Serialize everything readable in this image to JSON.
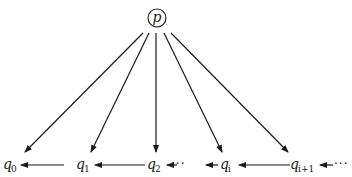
{
  "diagram": {
    "root": {
      "label": "p",
      "shape": "circle"
    },
    "nodes": [
      {
        "id": "q0",
        "base": "q",
        "sub": "0"
      },
      {
        "id": "q1",
        "base": "q",
        "sub": "1"
      },
      {
        "id": "q2",
        "base": "q",
        "sub": "2"
      },
      {
        "id": "qi",
        "base": "q",
        "sub": "i"
      },
      {
        "id": "qi1",
        "base": "q",
        "sub": "i+1"
      }
    ],
    "ellipsis": "···",
    "edges_from_root": [
      "q0",
      "q1",
      "q2",
      "qi",
      "qi1"
    ],
    "chain_edges": [
      {
        "from": "q1",
        "to": "q0"
      },
      {
        "from": "q2",
        "to": "q1"
      },
      {
        "from": "···",
        "to": "q2"
      },
      {
        "from": "qi",
        "to": "···"
      },
      {
        "from": "qi1",
        "to": "qi"
      },
      {
        "from": "···",
        "to": "qi1"
      }
    ],
    "colors": {
      "ink": "#1a1a1a",
      "background": "#ffffff"
    }
  }
}
